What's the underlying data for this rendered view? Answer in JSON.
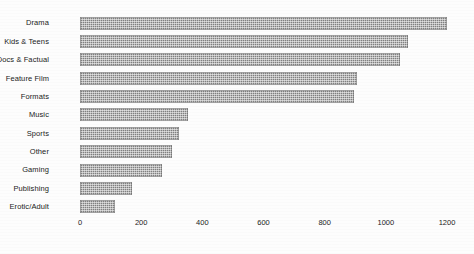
{
  "chart_data": {
    "type": "bar",
    "orientation": "horizontal",
    "title": "",
    "xlabel": "",
    "ylabel": "",
    "categories": [
      "Drama",
      "Kids & Teens",
      "Docs & Factual",
      "Feature Film",
      "Formats",
      "Music",
      "Sports",
      "Other",
      "Gaming",
      "Publishing",
      "Erotic/Adult"
    ],
    "values": [
      1235,
      1072,
      1045,
      905,
      895,
      353,
      324,
      300,
      268,
      170,
      114
    ],
    "xlim": [
      0,
      1235
    ],
    "xticks": [
      0,
      200,
      400,
      600,
      800,
      1000,
      1200
    ],
    "xtick_labels": [
      "0",
      "200",
      "400",
      "600",
      "800",
      "1000",
      "1200"
    ],
    "grid": false,
    "legend": null,
    "bar_color": "#808080"
  },
  "axis": {
    "tick_0": "0",
    "tick_1": "200",
    "tick_2": "400",
    "tick_3": "600",
    "tick_4": "800",
    "tick_5": "1000",
    "tick_6": "1200"
  }
}
